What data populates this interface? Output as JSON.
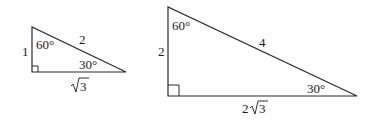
{
  "small_triangle": {
    "angle_top": "60°",
    "angle_right": "30°",
    "side_left": "1",
    "hypotenuse": "2",
    "base_coef": "",
    "base_radical": "3"
  },
  "large_triangle": {
    "angle_top": "60°",
    "angle_right": "30°",
    "side_left": "2",
    "hypotenuse": "4",
    "base_coef": "2",
    "base_radical": "3"
  },
  "colors": {
    "stroke": "#2a2a2a",
    "background": "#ffffff"
  }
}
